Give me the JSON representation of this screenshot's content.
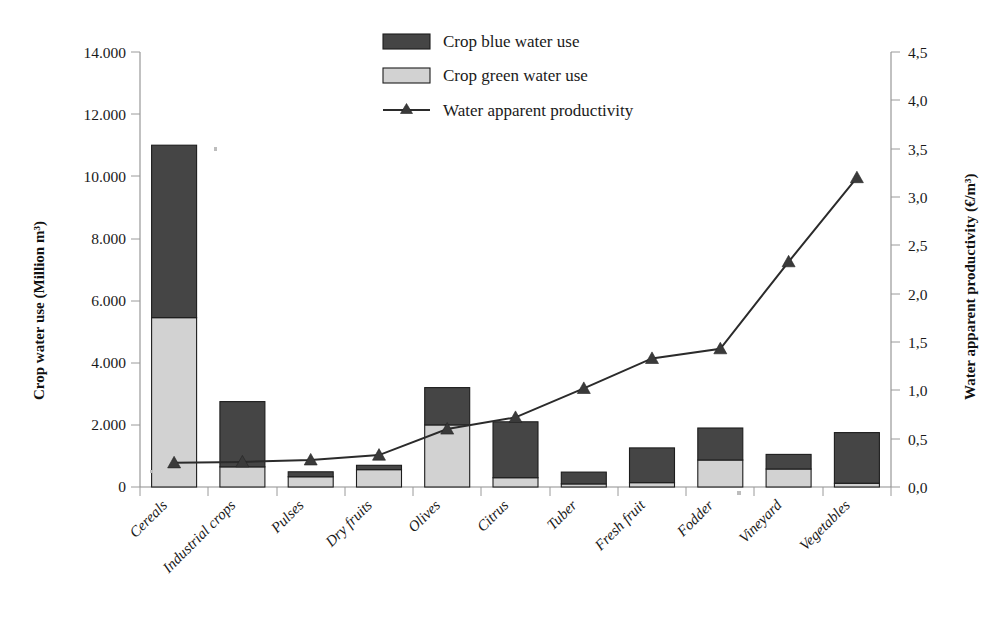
{
  "chart_data": {
    "type": "bar",
    "title": "",
    "subtitle": "",
    "xlabel": "",
    "ylabel": "Crop water use (Million m³)",
    "y2label": "Water apparent productivity (€/m³)",
    "grid": false,
    "legend_position": "top-center",
    "categories": [
      "Cereals",
      "Industrial crops",
      "Pulses",
      "Dry fruits",
      "Olives",
      "Citrus",
      "Tuber",
      "Fresh fruit",
      "Fodder",
      "Vineyard",
      "Vegetables"
    ],
    "ylim": [
      0,
      14000
    ],
    "ytick_labels": [
      "0",
      "2.000",
      "4.000",
      "6.000",
      "8.000",
      "10.000",
      "12.000",
      "14.000"
    ],
    "ytick_values": [
      0,
      2000,
      4000,
      6000,
      8000,
      10000,
      12000,
      14000
    ],
    "y2lim": [
      0,
      4.5
    ],
    "y2tick_labels": [
      "0,0",
      "0,5",
      "1,0",
      "1,5",
      "2,0",
      "2,5",
      "3,0",
      "3,5",
      "4,0",
      "4,5"
    ],
    "y2tick_values": [
      0,
      0.5,
      1.0,
      1.5,
      2.0,
      2.5,
      3.0,
      3.5,
      4.0,
      4.5
    ],
    "stacked": true,
    "series": [
      {
        "name": "Crop green water use",
        "axis": "left",
        "kind": "bar",
        "color": "#d2d2d2",
        "values": [
          5450,
          650,
          330,
          560,
          2000,
          300,
          100,
          140,
          870,
          580,
          120
        ]
      },
      {
        "name": "Crop blue water use",
        "axis": "left",
        "kind": "bar",
        "color": "#454545",
        "values": [
          5550,
          2100,
          160,
          140,
          1200,
          1800,
          380,
          1120,
          1030,
          470,
          1630
        ]
      },
      {
        "name": "Water apparent productivity",
        "axis": "right",
        "kind": "line",
        "color": "#2b2b2b",
        "marker": "triangle",
        "values": [
          0.25,
          0.26,
          0.28,
          0.33,
          0.6,
          0.72,
          1.02,
          1.33,
          1.43,
          2.33,
          3.2
        ]
      }
    ],
    "bar_totals": [
      11000,
      2750,
      490,
      700,
      3200,
      2100,
      480,
      1260,
      1900,
      1050,
      1750
    ]
  },
  "legend": {
    "items": [
      {
        "label": "Crop blue water use",
        "swatch": "dark-gray-rect",
        "color": "#454545"
      },
      {
        "label": "Crop green water use",
        "swatch": "light-gray-rect",
        "color": "#d2d2d2"
      },
      {
        "label": "Water apparent productivity",
        "swatch": "line-with-triangle-marker",
        "color": "#2b2b2b"
      }
    ]
  },
  "axes": {
    "left_title": "Crop water use (Million m³)",
    "right_title": "Water apparent productivity (€/m³)"
  }
}
